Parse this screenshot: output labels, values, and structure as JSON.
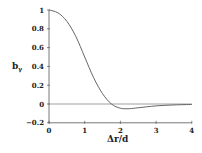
{
  "chart_data": {
    "type": "line",
    "title": "",
    "xlabel": "Δr/d",
    "ylabel": "b_γ",
    "xlim": [
      0,
      4
    ],
    "ylim": [
      -0.2,
      1
    ],
    "xticks": [
      "0",
      "1",
      "2",
      "3",
      "4"
    ],
    "yticks": [
      "-0.2",
      "0",
      "0.2",
      "0.4",
      "0.6",
      "0.8",
      "1"
    ],
    "grid": false,
    "legend": null,
    "reference_line": {
      "y": 0
    },
    "series": [
      {
        "name": "b_γ",
        "x": [
          0,
          0.25,
          0.5,
          0.75,
          1.0,
          1.25,
          1.5,
          1.75,
          2.0,
          2.25,
          2.5,
          3.0,
          3.5,
          4.0
        ],
        "y": [
          1.0,
          0.97,
          0.88,
          0.72,
          0.5,
          0.28,
          0.11,
          0.0,
          -0.045,
          -0.05,
          -0.04,
          -0.02,
          -0.01,
          -0.005
        ]
      }
    ]
  },
  "axes": {
    "x_label": "Δr/d",
    "y_label_main": "b",
    "y_label_sub": "γ"
  }
}
